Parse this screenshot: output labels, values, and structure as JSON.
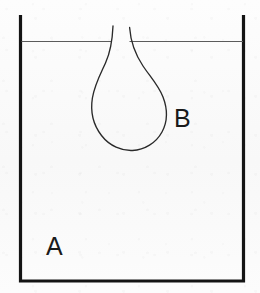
{
  "figure": {
    "type": "schematic-diagram",
    "background_color": "#fcfcfc",
    "width": 260,
    "height": 293
  },
  "labels": {
    "phase_a": "A",
    "phase_b": "B"
  },
  "elements": {
    "container": {
      "name": "open-rectangular-vessel",
      "stroke_color": "#141414",
      "stroke_width": 3.2,
      "left_wall_x": 20.5,
      "right_wall_x": 243.5,
      "top_y": 15,
      "bottom_y": 281
    },
    "liquid_surface": {
      "name": "liquid-surface-level-line",
      "stroke_color": "#5b5b5b",
      "stroke_width": 1.15,
      "y": 41.5,
      "left_segment_x": [
        21,
        112
      ],
      "right_segment_x": [
        129,
        243
      ]
    },
    "drop": {
      "name": "pendant-drop-outline",
      "stroke_color": "#2a2a2a",
      "stroke_width": 1.35,
      "neck_left_x": 112,
      "neck_right_x": 129,
      "neck_top_y": 26,
      "bulb_left_x": 92,
      "bulb_right_x": 166,
      "bulb_widest_y": 113,
      "bulb_bottom_y": 150
    }
  }
}
